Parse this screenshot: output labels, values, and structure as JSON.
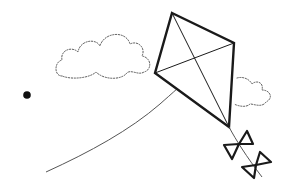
{
  "scene": {
    "description": "Line-art illustration of a kite flying with a string, two dotted clouds, bow-tie tail and a dot",
    "background": "#ffffff",
    "stroke_color": "#1a1a1a",
    "string_color": "#666666",
    "cloud_color": "#555555",
    "elements": [
      "cloud-left",
      "cloud-right",
      "kite",
      "kite-string",
      "kite-tail-bows",
      "dot"
    ]
  }
}
